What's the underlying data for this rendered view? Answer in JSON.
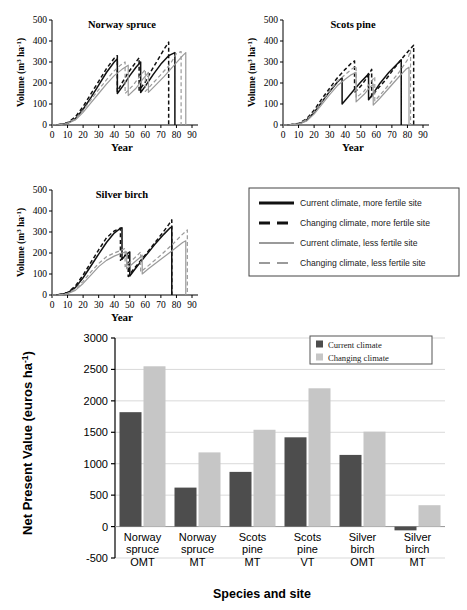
{
  "figure": {
    "panels": [
      {
        "id": "norway-spruce",
        "title": "Norway spruce"
      },
      {
        "id": "scots-pine",
        "title": "Scots pine"
      },
      {
        "id": "silver-birch",
        "title": "Silver birch"
      }
    ],
    "line_axis": {
      "ylabel": "Volume (m3 ha-1)",
      "ylabel_base": "Volume (m",
      "ylabel_sup1": "3",
      "ylabel_mid": " ha",
      "ylabel_sup2": "-1",
      "ylabel_end": ")",
      "xlabel": "Year",
      "yticks": [
        "0",
        "100",
        "200",
        "300",
        "400",
        "500"
      ],
      "xticks": [
        "0",
        "10",
        "20",
        "30",
        "40",
        "50",
        "60",
        "70",
        "80",
        "90"
      ],
      "ylim": [
        0,
        500
      ],
      "xlim": [
        0,
        90
      ]
    },
    "line_legend": {
      "items": [
        {
          "label": "Current climate, more fertile site",
          "color": "#111111",
          "dash": "solid"
        },
        {
          "label": "Changing climate, more fertile site",
          "color": "#111111",
          "dash": "dashed"
        },
        {
          "label": "Current climate, less fertile site",
          "color": "#9a9a9a",
          "dash": "solid"
        },
        {
          "label": "Changing climate, less fertile site",
          "color": "#9a9a9a",
          "dash": "dashed"
        }
      ]
    }
  },
  "chart_data": [
    {
      "type": "line",
      "title": "Norway spruce",
      "xlabel": "Year",
      "ylabel": "Volume (m3 ha-1)",
      "xlim": [
        0,
        90
      ],
      "ylim": [
        0,
        500
      ],
      "xticks": [
        0,
        10,
        20,
        30,
        40,
        50,
        60,
        70,
        80,
        90
      ],
      "yticks": [
        0,
        100,
        200,
        300,
        400,
        500
      ],
      "grid": false,
      "series": [
        {
          "name": "Current climate, more fertile site",
          "color": "#111111",
          "dash": "solid",
          "x": [
            0,
            5,
            10,
            15,
            20,
            25,
            30,
            35,
            40,
            42,
            42,
            46,
            50,
            54,
            57,
            57,
            60,
            65,
            70,
            75,
            79,
            79
          ],
          "y": [
            0,
            2,
            8,
            30,
            75,
            130,
            190,
            250,
            300,
            315,
            150,
            190,
            235,
            275,
            300,
            155,
            185,
            240,
            290,
            330,
            345,
            0
          ]
        },
        {
          "name": "Changing climate, more fertile site",
          "color": "#111111",
          "dash": "dashed",
          "x": [
            0,
            5,
            10,
            15,
            20,
            25,
            30,
            35,
            40,
            42,
            42,
            45,
            49,
            53,
            56,
            56,
            60,
            64,
            68,
            72,
            75,
            75
          ],
          "y": [
            0,
            3,
            11,
            38,
            88,
            148,
            208,
            268,
            318,
            330,
            160,
            200,
            250,
            290,
            320,
            165,
            205,
            260,
            310,
            360,
            395,
            0
          ]
        },
        {
          "name": "Current climate, less fertile site",
          "color": "#9a9a9a",
          "dash": "solid",
          "x": [
            0,
            5,
            10,
            15,
            20,
            25,
            30,
            35,
            40,
            45,
            49,
            49,
            54,
            58,
            62,
            62,
            66,
            72,
            78,
            84,
            86,
            86
          ],
          "y": [
            0,
            2,
            7,
            24,
            60,
            105,
            150,
            195,
            235,
            265,
            285,
            140,
            175,
            215,
            250,
            155,
            185,
            230,
            280,
            330,
            345,
            0
          ]
        },
        {
          "name": "Changing climate, less fertile site",
          "color": "#9a9a9a",
          "dash": "dashed",
          "x": [
            0,
            5,
            10,
            15,
            20,
            25,
            30,
            35,
            40,
            44,
            47,
            47,
            52,
            56,
            60,
            60,
            64,
            70,
            76,
            80,
            83,
            83
          ],
          "y": [
            0,
            3,
            9,
            30,
            70,
            120,
            168,
            215,
            258,
            285,
            300,
            150,
            188,
            228,
            265,
            160,
            192,
            240,
            290,
            340,
            350,
            0
          ]
        }
      ]
    },
    {
      "type": "line",
      "title": "Scots pine",
      "xlabel": "Year",
      "ylabel": "Volume (m3 ha-1)",
      "xlim": [
        0,
        90
      ],
      "ylim": [
        0,
        500
      ],
      "xticks": [
        0,
        10,
        20,
        30,
        40,
        50,
        60,
        70,
        80,
        90
      ],
      "yticks": [
        0,
        100,
        200,
        300,
        400,
        500
      ],
      "grid": false,
      "series": [
        {
          "name": "Current climate, more fertile site",
          "color": "#111111",
          "dash": "solid",
          "x": [
            0,
            5,
            10,
            15,
            20,
            25,
            30,
            35,
            38,
            38,
            42,
            46,
            50,
            54,
            55,
            55,
            58,
            62,
            68,
            74,
            76,
            76
          ],
          "y": [
            0,
            1,
            5,
            22,
            60,
            110,
            160,
            205,
            225,
            100,
            135,
            170,
            205,
            235,
            245,
            120,
            150,
            195,
            250,
            295,
            310,
            0
          ]
        },
        {
          "name": "Changing climate, more fertile site",
          "color": "#111111",
          "dash": "dashed",
          "x": [
            0,
            5,
            10,
            15,
            20,
            25,
            30,
            35,
            40,
            44,
            46,
            46,
            50,
            54,
            57,
            57,
            60,
            66,
            72,
            78,
            84,
            84
          ],
          "y": [
            0,
            2,
            7,
            28,
            70,
            125,
            175,
            225,
            265,
            295,
            305,
            155,
            185,
            225,
            265,
            135,
            165,
            215,
            275,
            330,
            380,
            0
          ]
        },
        {
          "name": "Current climate, less fertile site",
          "color": "#9a9a9a",
          "dash": "solid",
          "x": [
            0,
            5,
            10,
            15,
            20,
            25,
            30,
            35,
            40,
            44,
            47,
            47,
            52,
            56,
            58,
            58,
            62,
            68,
            74,
            79,
            81,
            81
          ],
          "y": [
            0,
            1,
            4,
            18,
            52,
            98,
            145,
            188,
            218,
            240,
            250,
            110,
            145,
            180,
            195,
            95,
            125,
            175,
            225,
            265,
            275,
            0
          ]
        },
        {
          "name": "Changing climate, less fertile site",
          "color": "#9a9a9a",
          "dash": "dashed",
          "x": [
            0,
            5,
            10,
            15,
            20,
            25,
            30,
            35,
            40,
            44,
            47,
            47,
            52,
            56,
            59,
            59,
            63,
            69,
            75,
            80,
            82,
            82
          ],
          "y": [
            0,
            2,
            6,
            24,
            62,
            112,
            162,
            208,
            240,
            265,
            280,
            130,
            160,
            200,
            230,
            115,
            148,
            200,
            255,
            310,
            355,
            0
          ]
        }
      ]
    },
    {
      "type": "line",
      "title": "Silver birch",
      "xlabel": "Year",
      "ylabel": "Volume (m3 ha-1)",
      "xlim": [
        0,
        90
      ],
      "ylim": [
        0,
        500
      ],
      "xticks": [
        0,
        10,
        20,
        30,
        40,
        50,
        60,
        70,
        80,
        90
      ],
      "yticks": [
        0,
        100,
        200,
        300,
        400,
        500
      ],
      "grid": false,
      "series": [
        {
          "name": "Current climate, more fertile site",
          "color": "#111111",
          "dash": "solid",
          "x": [
            0,
            5,
            10,
            15,
            20,
            25,
            30,
            35,
            40,
            44,
            45,
            45,
            48,
            50,
            50,
            54,
            60,
            66,
            72,
            76,
            77,
            77
          ],
          "y": [
            0,
            2,
            10,
            35,
            82,
            138,
            195,
            250,
            295,
            318,
            320,
            170,
            195,
            205,
            90,
            130,
            185,
            240,
            290,
            320,
            325,
            0
          ]
        },
        {
          "name": "Changing climate, more fertile site",
          "color": "#111111",
          "dash": "dashed",
          "x": [
            0,
            5,
            10,
            15,
            20,
            25,
            30,
            35,
            40,
            43,
            44,
            44,
            47,
            49,
            49,
            53,
            59,
            65,
            71,
            75,
            77,
            77
          ],
          "y": [
            0,
            3,
            12,
            42,
            95,
            155,
            215,
            272,
            305,
            315,
            318,
            165,
            190,
            200,
            88,
            128,
            182,
            238,
            295,
            335,
            358,
            0
          ]
        },
        {
          "name": "Current climate, less fertile site",
          "color": "#9a9a9a",
          "dash": "solid",
          "x": [
            0,
            5,
            10,
            15,
            20,
            25,
            30,
            35,
            40,
            45,
            48,
            48,
            52,
            56,
            58,
            58,
            62,
            70,
            78,
            84,
            86,
            86
          ],
          "y": [
            0,
            1,
            6,
            22,
            55,
            95,
            135,
            165,
            185,
            200,
            205,
            125,
            150,
            175,
            190,
            100,
            125,
            170,
            215,
            250,
            258,
            0
          ]
        },
        {
          "name": "Changing climate, less fertile site",
          "color": "#9a9a9a",
          "dash": "dashed",
          "x": [
            0,
            5,
            10,
            15,
            20,
            25,
            30,
            35,
            40,
            45,
            47,
            47,
            51,
            55,
            57,
            57,
            62,
            70,
            78,
            84,
            87,
            87
          ],
          "y": [
            0,
            2,
            8,
            28,
            65,
            110,
            150,
            182,
            200,
            215,
            222,
            135,
            162,
            190,
            205,
            110,
            140,
            190,
            245,
            290,
            310,
            0
          ]
        }
      ]
    },
    {
      "type": "bar",
      "title": "",
      "xlabel": "Species and site",
      "ylabel": "Net Present Value (euros ha-1)",
      "categories": [
        "Norway spruce OMT",
        "Norway spruce MT",
        "Scots pine MT",
        "Scots pine VT",
        "Silver birch OMT",
        "Silver birch MT"
      ],
      "category_lines": [
        [
          "Norway",
          "spruce",
          "OMT"
        ],
        [
          "Norway",
          "spruce",
          "MT"
        ],
        [
          "Scots",
          "pine",
          "MT"
        ],
        [
          "Scots",
          "pine",
          "VT"
        ],
        [
          "Silver",
          "birch",
          "OMT"
        ],
        [
          "Silver",
          "birch",
          "MT"
        ]
      ],
      "series": [
        {
          "name": "Current climate",
          "color": "#4d4d4d",
          "values": [
            1820,
            620,
            870,
            1420,
            1140,
            -60
          ]
        },
        {
          "name": "Changing climate",
          "color": "#c6c6c6",
          "values": [
            2550,
            1180,
            1540,
            2200,
            1510,
            340
          ]
        }
      ],
      "ylim": [
        -500,
        3000
      ],
      "yticks": [
        -500,
        0,
        500,
        1000,
        1500,
        2000,
        2500,
        3000
      ],
      "ytick_labels": [
        "-500",
        "0",
        "500",
        "1000",
        "1500",
        "2000",
        "2500",
        "3000"
      ],
      "grid": true,
      "legend_position": "top-right"
    }
  ]
}
